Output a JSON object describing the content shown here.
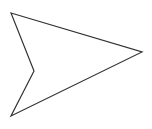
{
  "shape": {
    "type": "arrowhead-polygon",
    "points": [
      [
        11,
        13
      ],
      [
        142,
        52
      ],
      [
        11,
        116
      ],
      [
        34,
        71
      ]
    ],
    "stroke": "#333333",
    "stroke_width": 1.2,
    "fill": "#ffffff"
  },
  "background": "#ffffff"
}
